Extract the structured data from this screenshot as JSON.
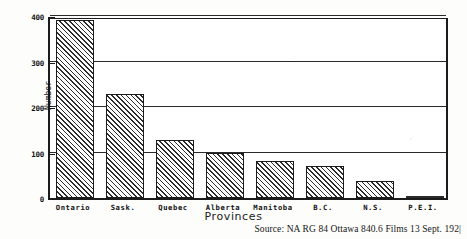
{
  "chart_data": {
    "type": "bar",
    "title": "",
    "xlabel": "Provinces",
    "ylabel": "Number",
    "categories": [
      "Ontario",
      "Sask.",
      "Quebec",
      "Alberta",
      "Manitoba",
      "B.C.",
      "N.S.",
      "P.E.I."
    ],
    "values": [
      392,
      228,
      128,
      100,
      82,
      70,
      38,
      3
    ],
    "ylim": [
      0,
      400
    ],
    "yticks": [
      0,
      100,
      200,
      300,
      400
    ],
    "ytick_labels": [
      "0",
      "100",
      "200",
      "300",
      "400"
    ],
    "grid": true,
    "legend": "none",
    "bar_style": "diagonal-hatch",
    "source_note": "Source: NA RG 84 Ottawa 840.6 Films 13 Sept. 192|"
  },
  "colors": {
    "ink": "#1b1b1b",
    "hatch": "#2b2b2b",
    "paper": "#fdfdfc",
    "plot_background": "#ffffff"
  }
}
